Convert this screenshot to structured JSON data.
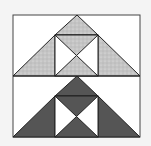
{
  "diagram": {
    "type": "quilt-block",
    "background": "#f4f4f4",
    "block_fill": "#ffffff",
    "stroke": "#222222",
    "colors": {
      "light_print": "#c8c8c8",
      "dark_solid": "#555555",
      "white": "#ffffff"
    },
    "halves": [
      {
        "name": "top-half",
        "fabric": "light_print"
      },
      {
        "name": "bottom-half",
        "fabric": "dark_solid"
      }
    ]
  }
}
